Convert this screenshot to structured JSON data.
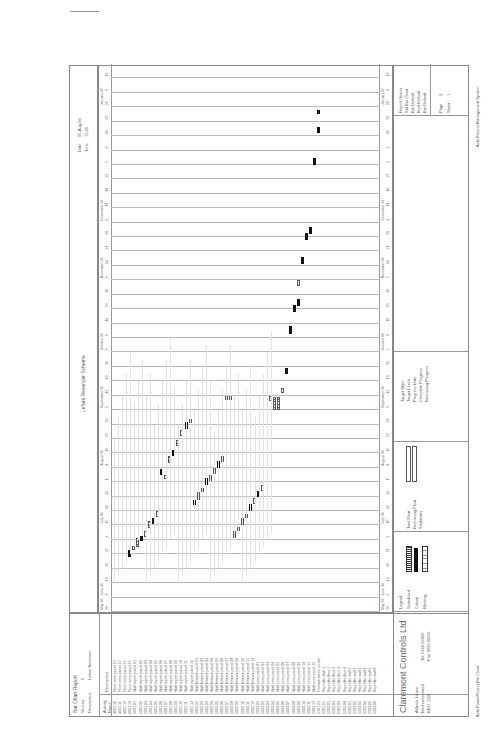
{
  "report": {
    "title": "Bar Chart Report",
    "version_label": "Version",
    "version": "0",
    "description_label": "Description",
    "description": "Lefare Reservoir",
    "scheme": "Lefare Reservoir Scheme",
    "date_label": "Date",
    "date": "05-Aug-96",
    "time_label": "Time",
    "time": "15:29"
  },
  "columns": {
    "activity": "Activity Name",
    "description": "Description"
  },
  "timeline": {
    "months": [
      "May 96",
      "June 96",
      "July 96",
      "August 96",
      "September 96",
      "October 96",
      "November 96",
      "December 96",
      "January 97"
    ],
    "weeks": [
      "29",
      "6",
      "13",
      "20",
      "27",
      "3",
      "10",
      "17",
      "24",
      "1",
      "8",
      "15",
      "22",
      "29",
      "5",
      "12",
      "19",
      "26",
      "2",
      "9",
      "16",
      "23",
      "30",
      "7",
      "14",
      "21",
      "28",
      "4",
      "11",
      "18",
      "25",
      "2",
      "9",
      "16",
      "23",
      "30",
      "6",
      "13"
    ]
  },
  "activities": [
    {
      "id": "4001.10",
      "desc": "Floor cons panel 10"
    },
    {
      "id": "4001.11",
      "desc": "Floor cons panel 11"
    },
    {
      "id": "4001.12",
      "desc": "Floor cons panel 12"
    },
    {
      "id": "4001.13",
      "desc": "Floor cons panel 13"
    },
    {
      "id": "5001.01",
      "desc": "Wall report panel 01"
    },
    {
      "id": "5001.02",
      "desc": "Wall report panel 02"
    },
    {
      "id": "5001.03",
      "desc": "Wall report panel 03"
    },
    {
      "id": "5001.04",
      "desc": "Wall report panel 04"
    },
    {
      "id": "5001.05",
      "desc": "Wall report panel 05"
    },
    {
      "id": "5001.06",
      "desc": "Wall report panel 06"
    },
    {
      "id": "5001.07",
      "desc": "Wall report panel 07"
    },
    {
      "id": "5001.08",
      "desc": "Wall report panel 08"
    },
    {
      "id": "5001.09",
      "desc": "Wall report panel 09"
    },
    {
      "id": "5001.10",
      "desc": "Wall report panel 10"
    },
    {
      "id": "5001.11",
      "desc": "Wall report panel 11"
    },
    {
      "id": "5001.12",
      "desc": "Wall report panel 12"
    },
    {
      "id": "5002.01",
      "desc": "Wall formwk panel 01"
    },
    {
      "id": "5002.02",
      "desc": "Wall formwk panel 02"
    },
    {
      "id": "5002.03",
      "desc": "Wall formwk panel 03"
    },
    {
      "id": "5002.04",
      "desc": "Wall formwk panel 04"
    },
    {
      "id": "5002.05",
      "desc": "Wall formwk panel 05"
    },
    {
      "id": "5002.06",
      "desc": "Wall formwk panel 06"
    },
    {
      "id": "5002.07",
      "desc": "Wall formwk panel 07"
    },
    {
      "id": "5002.08",
      "desc": "Wall formwk panel 08"
    },
    {
      "id": "5002.09",
      "desc": "Wall formwk panel 09"
    },
    {
      "id": "5002.10",
      "desc": "Wall formwk panel 10"
    },
    {
      "id": "5002.11",
      "desc": "Wall formwk panel 11"
    },
    {
      "id": "5002.12",
      "desc": "Wall formwk panel 12"
    },
    {
      "id": "5003.01",
      "desc": "Wall conc panel 01"
    },
    {
      "id": "5003.02",
      "desc": "Wall conc panel 02"
    },
    {
      "id": "5003.03",
      "desc": "Wall conc panel 03"
    },
    {
      "id": "5003.04",
      "desc": "Wall conc panel 04"
    },
    {
      "id": "5003.05",
      "desc": "Wall conc panel 05"
    },
    {
      "id": "5003.06",
      "desc": "Wall conc panel 06"
    },
    {
      "id": "5003.07",
      "desc": "Wall conc panel 07"
    },
    {
      "id": "5003.08",
      "desc": "Wall conc panel 08"
    },
    {
      "id": "5003.09",
      "desc": "Wall conc panel 09"
    },
    {
      "id": "5003.10",
      "desc": "Wall conc panel 10"
    },
    {
      "id": "5003.11",
      "desc": "Wall conc panel 11"
    },
    {
      "id": "5003.12",
      "desc": "Wall conc panel 12"
    },
    {
      "id": "5101.01",
      "desc": "Formwk arrive on site"
    },
    {
      "id": "5201.01",
      "desc": "Reprofile slab 1"
    },
    {
      "id": "5202.01",
      "desc": "Reprofile floor 1"
    },
    {
      "id": "5202.02",
      "desc": "Reprofile floor 2"
    },
    {
      "id": "5202.03",
      "desc": "Reprofile floor 3"
    },
    {
      "id": "5202.04",
      "desc": "Reprofile floor 4"
    },
    {
      "id": "5203.01",
      "desc": "Reprofile wall 1"
    },
    {
      "id": "5203.02",
      "desc": "Reprofile wall 2"
    },
    {
      "id": "5203.03",
      "desc": "Reprofile wall 3"
    },
    {
      "id": "5203.04",
      "desc": "Reprofile wall 4"
    },
    {
      "id": "5203.05",
      "desc": "Reprofile wall 5"
    },
    {
      "id": "5203.06",
      "desc": "Reprofile wall 6"
    }
  ],
  "footer": {
    "company": "Claremont Controls Ltd",
    "address1": "Aldwick House",
    "address2": "Northumberland",
    "address3": "NE61 1QH",
    "tel": "Tel: 0666 00000",
    "fax": "Fax: 0666 00001",
    "legend_title": "Legend",
    "legend": [
      {
        "label": "Scheduled",
        "key": "hatched"
      },
      {
        "label": "Critical",
        "key": "solid"
      },
      {
        "label": "Working",
        "key": "open"
      }
    ],
    "legend2": [
      {
        "label": "Total Float"
      },
      {
        "label": "Remaining Float"
      },
      {
        "label": "Shutdown"
      }
    ],
    "target_labels": [
      "Target Start",
      "Target Finish",
      "Progress Date",
      "Complete Progress",
      "Remaining Progress"
    ],
    "report_info": [
      "Report Option",
      "Std Bar Chart",
      "Bar Default",
      "Brief Default",
      "Bar Default"
    ],
    "page_label": "Page",
    "page": "2",
    "sheet_label": "Sheet",
    "sheet": "1",
    "system": "Asta Project Management System",
    "software": "Asta PowerProject Bar Chart"
  },
  "chart_data": {
    "type": "gantt",
    "xlabel": "Date (weeks)",
    "x_range": [
      "29 Apr 96",
      "13 Jan 97"
    ],
    "orientation": "rotated -90deg (landscape document)",
    "note": "Bars read approximately from week grid; index = week offset from 29 Apr 96",
    "bars": [
      {
        "row": "5101.01",
        "start": 14,
        "end": 14.6,
        "type": "hatched"
      },
      {
        "row": "5201.01",
        "start": 14,
        "end": 14.6,
        "type": "hatched"
      },
      {
        "row": "5003.12",
        "start": 14.5,
        "end": 15,
        "type": "open"
      }
    ]
  }
}
